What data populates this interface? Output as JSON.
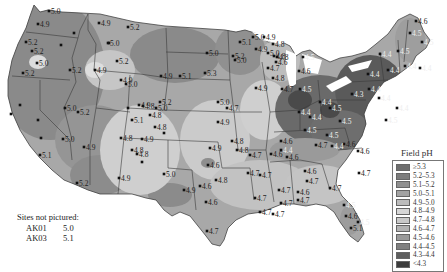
{
  "legend": {
    "title": "Field pH",
    "items": [
      {
        "label": "≥5.3",
        "color": "#6e6e6e"
      },
      {
        "label": "5.2–5.3",
        "color": "#7d7d7d"
      },
      {
        "label": "5.1–5.2",
        "color": "#8f8f8f"
      },
      {
        "label": "5.0–5.1",
        "color": "#a3a3a3"
      },
      {
        "label": "4.9–5.0",
        "color": "#bcbcbc"
      },
      {
        "label": "4.8–4.9",
        "color": "#d6d6d6"
      },
      {
        "label": "4.7–4.8",
        "color": "#c9c9c9"
      },
      {
        "label": "4.6–4.7",
        "color": "#b3b3b3"
      },
      {
        "label": "4.5–4.6",
        "color": "#9a9a9a"
      },
      {
        "label": "4.4–4.5",
        "color": "#7f7f7f"
      },
      {
        "label": "4.3–4.4",
        "color": "#5e5e5e"
      },
      {
        "label": "<4.3",
        "color": "#3c3c3c"
      }
    ]
  },
  "notes": {
    "title": "Sites not pictured:",
    "sites": [
      {
        "id": "AK01",
        "value": "5.0"
      },
      {
        "id": "AK03",
        "value": "5.1"
      }
    ]
  },
  "stations": [
    {
      "x": 49,
      "y": 11,
      "v": "5.0"
    },
    {
      "x": 38,
      "y": 24,
      "v": "4.9"
    },
    {
      "x": 26,
      "y": 42,
      "v": "5.2"
    },
    {
      "x": 32,
      "y": 51,
      "v": "5.2"
    },
    {
      "x": 37,
      "y": 63,
      "v": "5.0"
    },
    {
      "x": 23,
      "y": 73,
      "v": "5.2"
    },
    {
      "x": 74,
      "y": 33,
      "v": ""
    },
    {
      "x": 61,
      "y": 45,
      "v": ""
    },
    {
      "x": 70,
      "y": 70,
      "v": "5.2"
    },
    {
      "x": 99,
      "y": 23,
      "v": "4.9"
    },
    {
      "x": 108,
      "y": 43,
      "v": "5.0"
    },
    {
      "x": 95,
      "y": 70,
      "v": "4.9"
    },
    {
      "x": 128,
      "y": 27,
      "v": "5.2"
    },
    {
      "x": 109,
      "y": 43,
      "v": ""
    },
    {
      "x": 117,
      "y": 61,
      "v": "5.2"
    },
    {
      "x": 121,
      "y": 80,
      "v": "4.9"
    },
    {
      "x": 126,
      "y": 84,
      "v": "5.0"
    },
    {
      "x": 161,
      "y": 76,
      "v": "4.9"
    },
    {
      "x": 180,
      "y": 76,
      "v": "5.1"
    },
    {
      "x": 205,
      "y": 73,
      "v": "5.3"
    },
    {
      "x": 160,
      "y": 102,
      "v": "5.2"
    },
    {
      "x": 156,
      "y": 108,
      "v": "5.0"
    },
    {
      "x": 128,
      "y": 108,
      "v": ""
    },
    {
      "x": 139,
      "y": 105,
      "v": "4.9"
    },
    {
      "x": 143,
      "y": 106,
      "v": "4.8"
    },
    {
      "x": 150,
      "y": 115,
      "v": "4.8"
    },
    {
      "x": 132,
      "y": 120,
      "v": "5.1"
    },
    {
      "x": 155,
      "y": 127,
      "v": "4.8"
    },
    {
      "x": 164,
      "y": 133,
      "v": ""
    },
    {
      "x": 121,
      "y": 138,
      "v": "4.8"
    },
    {
      "x": 142,
      "y": 139,
      "v": "4.9"
    },
    {
      "x": 132,
      "y": 150,
      "v": "4.8"
    },
    {
      "x": 137,
      "y": 154,
      "v": "4.8"
    },
    {
      "x": 119,
      "y": 178,
      "v": "4.9"
    },
    {
      "x": 164,
      "y": 174,
      "v": "5.0"
    },
    {
      "x": 65,
      "y": 108,
      "v": "5.0"
    },
    {
      "x": 38,
      "y": 120,
      "v": ""
    },
    {
      "x": 78,
      "y": 112,
      "v": "5.2"
    },
    {
      "x": 41,
      "y": 138,
      "v": ""
    },
    {
      "x": 63,
      "y": 139,
      "v": "5.0"
    },
    {
      "x": 40,
      "y": 155,
      "v": "5.1"
    },
    {
      "x": 77,
      "y": 183,
      "v": "5.2"
    },
    {
      "x": 84,
      "y": 147,
      "v": "4.9"
    },
    {
      "x": 11,
      "y": 114,
      "v": ""
    },
    {
      "x": 20,
      "y": 105,
      "v": ""
    },
    {
      "x": 142,
      "y": 162,
      "v": ""
    },
    {
      "x": 207,
      "y": 53,
      "v": "5.0"
    },
    {
      "x": 240,
      "y": 42,
      "v": "5.1"
    },
    {
      "x": 233,
      "y": 56,
      "v": "5.2"
    },
    {
      "x": 235,
      "y": 60,
      "v": "5.0"
    },
    {
      "x": 253,
      "y": 37,
      "v": "5.0"
    },
    {
      "x": 264,
      "y": 37,
      "v": "4.9"
    },
    {
      "x": 256,
      "y": 49,
      "v": "4.9"
    },
    {
      "x": 268,
      "y": 53,
      "v": "5.0"
    },
    {
      "x": 274,
      "y": 56,
      "v": "4.8"
    },
    {
      "x": 277,
      "y": 57,
      "v": "4.8"
    },
    {
      "x": 276,
      "y": 62,
      "v": "4.6"
    },
    {
      "x": 268,
      "y": 68,
      "v": "4.7"
    },
    {
      "x": 273,
      "y": 78,
      "v": "4.8"
    },
    {
      "x": 282,
      "y": 89,
      "v": "4.7"
    },
    {
      "x": 256,
      "y": 88,
      "v": "4.9"
    },
    {
      "x": 273,
      "y": 44,
      "v": "4.8"
    },
    {
      "x": 299,
      "y": 71,
      "v": "4.6"
    },
    {
      "x": 300,
      "y": 89,
      "v": "4.5"
    },
    {
      "x": 303,
      "y": 57,
      "v": "4.5"
    },
    {
      "x": 218,
      "y": 102,
      "v": "5.0"
    },
    {
      "x": 227,
      "y": 108,
      "v": "4.7"
    },
    {
      "x": 218,
      "y": 122,
      "v": "4.9"
    },
    {
      "x": 232,
      "y": 141,
      "v": "4.8"
    },
    {
      "x": 210,
      "y": 148,
      "v": "4.9"
    },
    {
      "x": 208,
      "y": 165,
      "v": "4.6"
    },
    {
      "x": 216,
      "y": 180,
      "v": "4.8"
    },
    {
      "x": 184,
      "y": 190,
      "v": "4.9"
    },
    {
      "x": 200,
      "y": 186,
      "v": "4.6"
    },
    {
      "x": 206,
      "y": 202,
      "v": "4.6"
    },
    {
      "x": 207,
      "y": 231,
      "v": "4.7"
    },
    {
      "x": 237,
      "y": 150,
      "v": "4.8"
    },
    {
      "x": 250,
      "y": 155,
      "v": "4.7"
    },
    {
      "x": 248,
      "y": 173,
      "v": "4.7"
    },
    {
      "x": 260,
      "y": 175,
      "v": "4.7"
    },
    {
      "x": 255,
      "y": 198,
      "v": "4.7"
    },
    {
      "x": 260,
      "y": 212,
      "v": "4.7"
    },
    {
      "x": 273,
      "y": 214,
      "v": "4.7"
    },
    {
      "x": 281,
      "y": 203,
      "v": "4.7"
    },
    {
      "x": 271,
      "y": 154,
      "v": "4.6"
    },
    {
      "x": 281,
      "y": 141,
      "v": "4.6"
    },
    {
      "x": 279,
      "y": 190,
      "v": "4.7"
    },
    {
      "x": 281,
      "y": 150,
      "v": "4.4"
    },
    {
      "x": 287,
      "y": 157,
      "v": "4.6"
    },
    {
      "x": 298,
      "y": 192,
      "v": "4.6"
    },
    {
      "x": 305,
      "y": 171,
      "v": "4.6"
    },
    {
      "x": 307,
      "y": 181,
      "v": "4.7"
    },
    {
      "x": 298,
      "y": 200,
      "v": "4.7"
    },
    {
      "x": 330,
      "y": 188,
      "v": "4.7"
    },
    {
      "x": 344,
      "y": 205,
      "v": "4.5"
    },
    {
      "x": 346,
      "y": 216,
      "v": "4.6"
    },
    {
      "x": 358,
      "y": 222,
      "v": "4.5"
    },
    {
      "x": 351,
      "y": 228,
      "v": "5.1"
    },
    {
      "x": 359,
      "y": 173,
      "v": "4.7"
    },
    {
      "x": 299,
      "y": 112,
      "v": "4.4"
    },
    {
      "x": 310,
      "y": 117,
      "v": "4.4"
    },
    {
      "x": 320,
      "y": 102,
      "v": "4.4"
    },
    {
      "x": 330,
      "y": 108,
      "v": "4.5"
    },
    {
      "x": 340,
      "y": 121,
      "v": "4.5"
    },
    {
      "x": 327,
      "y": 135,
      "v": "4.5"
    },
    {
      "x": 344,
      "y": 144,
      "v": "4.6"
    },
    {
      "x": 358,
      "y": 151,
      "v": "4.6"
    },
    {
      "x": 305,
      "y": 130,
      "v": "4.5"
    },
    {
      "x": 316,
      "y": 145,
      "v": "4.7"
    },
    {
      "x": 332,
      "y": 146,
      "v": "4.4"
    },
    {
      "x": 352,
      "y": 94,
      "v": "4.3"
    },
    {
      "x": 369,
      "y": 89,
      "v": "4.4"
    },
    {
      "x": 379,
      "y": 98,
      "v": "4.4"
    },
    {
      "x": 388,
      "y": 70,
      "v": "4.4"
    },
    {
      "x": 368,
      "y": 74,
      "v": "4.4"
    },
    {
      "x": 380,
      "y": 54,
      "v": "4.4"
    },
    {
      "x": 398,
      "y": 51,
      "v": "4.5"
    },
    {
      "x": 416,
      "y": 21,
      "v": "4.6"
    },
    {
      "x": 410,
      "y": 33,
      "v": "4.5"
    },
    {
      "x": 422,
      "y": 42,
      "v": "4.5"
    },
    {
      "x": 405,
      "y": 66,
      "v": "4.4"
    },
    {
      "x": 420,
      "y": 68,
      "v": "4.4"
    },
    {
      "x": 386,
      "y": 120,
      "v": "4.5"
    },
    {
      "x": 397,
      "y": 108,
      "v": "4.4"
    }
  ]
}
